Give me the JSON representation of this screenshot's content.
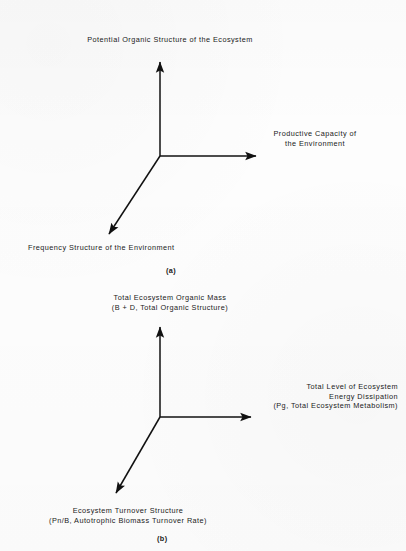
{
  "figure": {
    "background_color": "#fdfdfd",
    "ink_color": "#111111",
    "panels": [
      {
        "id": "a",
        "caption": "(a)",
        "axes": {
          "vertical_label": "Potential Organic Structure of the Ecosystem",
          "horizontal_label_line1": "Productive Capacity of",
          "horizontal_label_line2": "the Environment",
          "diagonal_label": "Frequency Structure of the Environment"
        },
        "geometry": {
          "origin_x": 160,
          "origin_y": 156,
          "vertical_tip_y": 58,
          "horizontal_tip_x": 260,
          "diagonal_tip_x": 105,
          "diagonal_tip_y": 238
        }
      },
      {
        "id": "b",
        "caption": "(b)",
        "axes": {
          "vertical_label_line1": "Total Ecosystem Organic Mass",
          "vertical_label_line2": "(B + D, Total Organic Structure)",
          "horizontal_label_line1": "Total Level of Ecosystem",
          "horizontal_label_line2": "Energy Dissipation",
          "horizontal_label_line3": "(Pg, Total Ecosystem Metabolism)",
          "diagonal_label_line1": "Ecosystem Turnover Structure",
          "diagonal_label_line2": "(Pn/B, Autotrophic Biomass Turnover Rate)"
        },
        "geometry": {
          "origin_x": 160,
          "origin_y": 417,
          "vertical_tip_y": 323,
          "horizontal_tip_x": 255,
          "diagonal_tip_x": 112,
          "diagonal_tip_y": 497
        }
      }
    ]
  }
}
